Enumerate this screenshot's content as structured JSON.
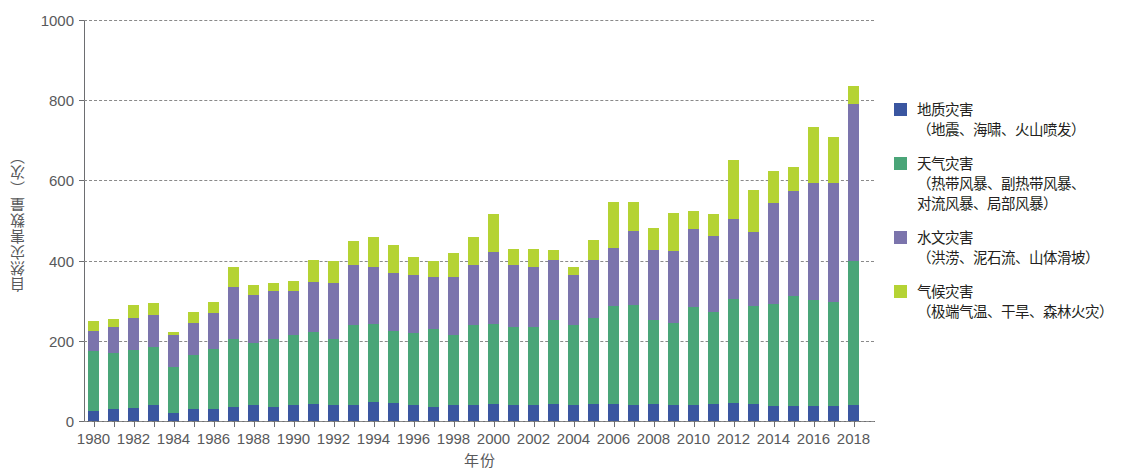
{
  "chart_data": {
    "type": "bar",
    "subtype": "stacked-column",
    "title": "",
    "xlabel": "年份",
    "ylabel": "自然灾害数量（次）",
    "ylim": [
      0,
      1000
    ],
    "ytick_labels": [
      "0",
      "200",
      "400",
      "600",
      "800",
      "1000"
    ],
    "yticks": [
      0,
      200,
      400,
      600,
      800,
      1000
    ],
    "grid": "horizontal-dashed",
    "legend_position": "right",
    "categories": [
      "1980",
      "1981",
      "1982",
      "1983",
      "1984",
      "1985",
      "1986",
      "1987",
      "1988",
      "1989",
      "1990",
      "1991",
      "1992",
      "1993",
      "1994",
      "1995",
      "1996",
      "1997",
      "1998",
      "1999",
      "2000",
      "2001",
      "2002",
      "2003",
      "2004",
      "2005",
      "2006",
      "2007",
      "2008",
      "2009",
      "2010",
      "2011",
      "2012",
      "2013",
      "2014",
      "2015",
      "2016",
      "2017",
      "2018"
    ],
    "xtick_labels": [
      "1980",
      "1982",
      "1984",
      "1986",
      "1988",
      "1990",
      "1992",
      "1994",
      "1996",
      "1998",
      "2000",
      "2002",
      "2004",
      "2006",
      "2008",
      "2010",
      "2012",
      "2014",
      "2016",
      "2018"
    ],
    "series": [
      {
        "name": "地质灾害",
        "color": "#3a56a0",
        "values": [
          25,
          30,
          33,
          40,
          20,
          30,
          30,
          35,
          40,
          35,
          40,
          42,
          40,
          40,
          48,
          45,
          40,
          35,
          40,
          40,
          42,
          40,
          40,
          42,
          40,
          42,
          42,
          40,
          42,
          40,
          40,
          42,
          45,
          42,
          38,
          38,
          38,
          38,
          40
        ]
      },
      {
        "name": "天气灾害",
        "color": "#4aa578",
        "values": [
          150,
          140,
          145,
          145,
          115,
          135,
          150,
          170,
          155,
          170,
          175,
          180,
          165,
          200,
          195,
          180,
          180,
          195,
          175,
          200,
          200,
          195,
          195,
          210,
          200,
          215,
          245,
          250,
          210,
          205,
          245,
          230,
          260,
          245,
          255,
          275,
          265,
          260,
          360
        ]
      },
      {
        "name": "水文灾害",
        "color": "#7b74ac",
        "values": [
          50,
          65,
          80,
          80,
          80,
          80,
          90,
          130,
          120,
          120,
          110,
          125,
          140,
          150,
          140,
          145,
          145,
          130,
          145,
          150,
          180,
          155,
          150,
          150,
          125,
          145,
          145,
          185,
          175,
          180,
          195,
          190,
          200,
          185,
          250,
          260,
          290,
          295,
          390
        ]
      },
      {
        "name": "气候灾害",
        "color": "#b5d334",
        "values": [
          25,
          20,
          32,
          30,
          8,
          28,
          27,
          50,
          25,
          20,
          25,
          55,
          55,
          60,
          75,
          70,
          45,
          40,
          60,
          70,
          95,
          40,
          45,
          25,
          20,
          50,
          115,
          70,
          55,
          95,
          45,
          55,
          145,
          105,
          80,
          60,
          140,
          115,
          45
        ]
      }
    ],
    "totals": [
      250,
      255,
      290,
      295,
      223,
      273,
      297,
      385,
      340,
      345,
      350,
      402,
      400,
      450,
      458,
      440,
      410,
      400,
      420,
      460,
      517,
      430,
      430,
      427,
      385,
      452,
      547,
      545,
      482,
      520,
      525,
      517,
      650,
      577,
      623,
      633,
      733,
      708,
      835
    ]
  },
  "legend": {
    "items": [
      {
        "color": "#3a56a0",
        "name": "地质灾害",
        "detail": "（地震、海啸、火山喷发）"
      },
      {
        "color": "#4aa578",
        "name": "天气灾害",
        "detail": "（热带风暴、副热带风暴、\n对流风暴、局部风暴）"
      },
      {
        "color": "#7b74ac",
        "name": "水文灾害",
        "detail": "（洪涝、泥石流、山体滑坡）"
      },
      {
        "color": "#b5d334",
        "name": "气候灾害",
        "detail": "（极端气温、干旱、森林火灾）"
      }
    ]
  }
}
